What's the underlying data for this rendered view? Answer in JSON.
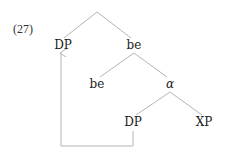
{
  "example_number": "(27)",
  "tree": {
    "root": {
      "label": "",
      "x": 97,
      "y": 12
    },
    "nodes": [
      {
        "id": "dp_spec",
        "label": "DP",
        "x": 63,
        "y": 49
      },
      {
        "id": "be_bar",
        "label": "be",
        "x": 134,
        "y": 49
      },
      {
        "id": "be_head",
        "label": "be",
        "x": 97,
        "y": 88
      },
      {
        "id": "alpha",
        "label": "α",
        "x": 170,
        "y": 88
      },
      {
        "id": "dp_low",
        "label": "DP",
        "x": 133,
        "y": 126
      },
      {
        "id": "xp",
        "label": "XP",
        "x": 204,
        "y": 126
      }
    ],
    "edges": [
      [
        "root",
        "dp_spec"
      ],
      [
        "root",
        "be_bar"
      ],
      [
        "be_bar",
        "be_head"
      ],
      [
        "be_bar",
        "alpha"
      ],
      [
        "alpha",
        "dp_low"
      ],
      [
        "alpha",
        "xp"
      ]
    ],
    "movement": {
      "from": "dp_low",
      "to": "dp_spec",
      "type": "arrow"
    }
  },
  "colors": {
    "lines": "#b5b5b5",
    "text": "#1a1a1a"
  }
}
